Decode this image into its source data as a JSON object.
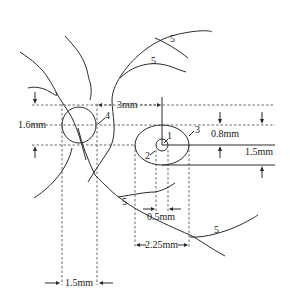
{
  "diagram": {
    "type": "retinal-measurement-schematic",
    "labels": {
      "fovea_marker": "1",
      "foveola_marker": "2",
      "macula_marker": "3",
      "optic_disc_marker": "4",
      "vessel_marker": "5"
    },
    "dimensions": {
      "disc_to_fovea_horizontal": "3mm",
      "disc_vertical": "1.6mm",
      "disc_horizontal": "1.5mm",
      "macula_upper": "0.8mm",
      "macula_vertical": "1.5mm",
      "fovea_width": "0.5mm",
      "macula_width": "2.25mm"
    },
    "colors": {
      "stroke": "#2a2a2a",
      "background": "#ffffff"
    }
  }
}
